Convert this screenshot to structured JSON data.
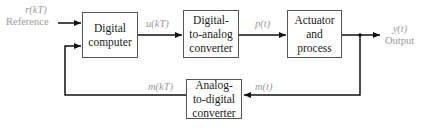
{
  "diagram": {
    "type": "block-diagram",
    "title": "",
    "blocks": {
      "computer": {
        "lines": [
          "Digital",
          "computer"
        ]
      },
      "dac": {
        "lines": [
          "Digital-",
          "to-analog",
          "converter"
        ]
      },
      "actuator": {
        "lines": [
          "Actuator",
          "and",
          "process"
        ]
      },
      "adc": {
        "lines": [
          "Analog-",
          "to-digital",
          "converter"
        ]
      }
    },
    "signals": {
      "reference_symbol": "r(kT)",
      "reference_label": "Reference",
      "u": "u(kT)",
      "p": "p(t)",
      "output_symbol": "y(t)",
      "output_label": "Output",
      "m_t": "m(t)",
      "m_kT": "m(kT)"
    },
    "colors": {
      "line": "#111111",
      "box_border": "#555555",
      "signal_label": "#9a9a9a"
    }
  }
}
